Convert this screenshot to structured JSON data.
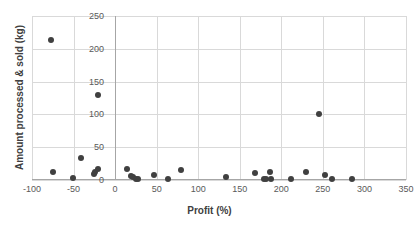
{
  "chart_data": {
    "type": "scatter",
    "title": "",
    "xlabel": "Profit (%)",
    "ylabel": "Amount processed & sold (kg)",
    "xlim": [
      -100,
      350
    ],
    "ylim": [
      0,
      250
    ],
    "xticks": [
      -100,
      -50,
      0,
      50,
      100,
      150,
      200,
      250,
      300,
      350
    ],
    "yticks": [
      0,
      50,
      100,
      150,
      200,
      250
    ],
    "grid": true,
    "legend": false,
    "marker_color": "#404040",
    "gridline_color": "#D9D9D9",
    "axis_color": "#A6A6A6",
    "series": [
      {
        "name": "Farms",
        "points": [
          {
            "x": -77,
            "y": 214
          },
          {
            "x": -75,
            "y": 12
          },
          {
            "x": -51,
            "y": 3
          },
          {
            "x": -41,
            "y": 33
          },
          {
            "x": -26,
            "y": 9
          },
          {
            "x": -24,
            "y": 12
          },
          {
            "x": -21,
            "y": 17
          },
          {
            "x": -20,
            "y": 129
          },
          {
            "x": 14,
            "y": 17
          },
          {
            "x": 19,
            "y": 6
          },
          {
            "x": 22,
            "y": 4
          },
          {
            "x": 25,
            "y": 2
          },
          {
            "x": 27,
            "y": 2
          },
          {
            "x": 47,
            "y": 7
          },
          {
            "x": 64,
            "y": 2
          },
          {
            "x": 79,
            "y": 15
          },
          {
            "x": 133,
            "y": 5
          },
          {
            "x": 168,
            "y": 11
          },
          {
            "x": 179,
            "y": 1
          },
          {
            "x": 182,
            "y": 1
          },
          {
            "x": 186,
            "y": 12
          },
          {
            "x": 187,
            "y": 1
          },
          {
            "x": 212,
            "y": 2
          },
          {
            "x": 230,
            "y": 12
          },
          {
            "x": 245,
            "y": 100
          },
          {
            "x": 253,
            "y": 8
          },
          {
            "x": 261,
            "y": 1
          },
          {
            "x": 285,
            "y": 1
          }
        ]
      }
    ]
  }
}
